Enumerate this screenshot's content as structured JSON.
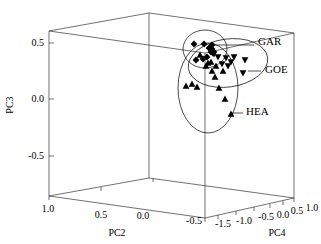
{
  "chart_data": {
    "type": "scatter",
    "title": "",
    "subtitle": "",
    "projection": "3d",
    "grid": false,
    "legend_position": "inline-annotations",
    "axes": {
      "x": {
        "label": "PC2",
        "ticks": [
          "1.0",
          "0.5",
          "0.0",
          "-0.5"
        ],
        "tick_values": [
          1.0,
          0.5,
          0.0,
          -0.5
        ],
        "range": [
          1.0,
          -0.9
        ]
      },
      "y": {
        "label": "PC3",
        "ticks": [
          "0.5",
          "0.0",
          "-0.5"
        ],
        "tick_values": [
          0.5,
          0.0,
          -0.5
        ],
        "range": [
          -0.75,
          0.65
        ]
      },
      "z": {
        "label": "PC4",
        "ticks": [
          "-1.5",
          "-1.0",
          "-0.5",
          "0.0",
          "0.5",
          "1.0"
        ],
        "tick_values": [
          -1.5,
          -1.0,
          -0.5,
          0.0,
          0.5,
          1.0
        ],
        "range": [
          -1.8,
          1.2
        ]
      }
    },
    "annotations": [
      {
        "text": "GAR",
        "x": 258,
        "y": 45
      },
      {
        "text": "GOE",
        "x": 265,
        "y": 73
      },
      {
        "text": "HEA",
        "x": 246,
        "y": 115
      }
    ],
    "series": [
      {
        "name": "GAR",
        "marker": "diamond",
        "color": "#000000",
        "points_px": [
          [
            194,
            44
          ],
          [
            204,
            44
          ],
          [
            212,
            45
          ],
          [
            209,
            48
          ],
          [
            212,
            49
          ],
          [
            213,
            51
          ],
          [
            196,
            60
          ],
          [
            203,
            59
          ],
          [
            207,
            57
          ],
          [
            211,
            52
          ],
          [
            213,
            53
          ]
        ]
      },
      {
        "name": "GOE",
        "marker": "triangle-down",
        "color": "#000000",
        "points_px": [
          [
            214,
            54
          ],
          [
            218,
            57
          ],
          [
            226,
            58
          ],
          [
            234,
            57
          ],
          [
            245,
            60
          ],
          [
            222,
            64
          ],
          [
            228,
            66
          ],
          [
            243,
            73
          ],
          [
            231,
            62
          ]
        ]
      },
      {
        "name": "HEA",
        "marker": "triangle-up",
        "color": "#000000",
        "points_px": [
          [
            200,
            55
          ],
          [
            211,
            62
          ],
          [
            216,
            66
          ],
          [
            206,
            66
          ],
          [
            212,
            71
          ],
          [
            223,
            71
          ],
          [
            186,
            86
          ],
          [
            192,
            84
          ],
          [
            197,
            87
          ],
          [
            219,
            88
          ],
          [
            225,
            99
          ],
          [
            231,
            114
          ],
          [
            215,
            77
          ],
          [
            208,
            63
          ]
        ]
      }
    ],
    "ellipses": [
      {
        "group": "GAR",
        "cx": 205,
        "cy": 49,
        "rx": 22,
        "ry": 19,
        "rotation": 0
      },
      {
        "group": "GOE",
        "cx": 228,
        "cy": 63,
        "rx": 40,
        "ry": 24,
        "rotation": -8
      },
      {
        "group": "HEA",
        "cx": 208,
        "cy": 88,
        "rx": 30,
        "ry": 45,
        "rotation": 0
      }
    ]
  }
}
